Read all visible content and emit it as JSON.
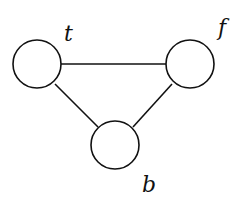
{
  "diagram": {
    "type": "graph",
    "nodes": [
      {
        "id": "t",
        "label": "t",
        "cx": 37,
        "cy": 64,
        "r": 24,
        "label_x": 64,
        "label_y": 41
      },
      {
        "id": "f",
        "label": "f",
        "cx": 190,
        "cy": 64,
        "r": 24,
        "label_x": 218,
        "label_y": 35
      },
      {
        "id": "b",
        "label": "b",
        "cx": 115,
        "cy": 145,
        "r": 24,
        "label_x": 142,
        "label_y": 192
      }
    ],
    "edges": [
      {
        "from": "t",
        "to": "f"
      },
      {
        "from": "t",
        "to": "b"
      },
      {
        "from": "f",
        "to": "b"
      }
    ],
    "colors": {
      "stroke": "#111111",
      "fill": "#ffffff",
      "background": "#ffffff"
    }
  }
}
